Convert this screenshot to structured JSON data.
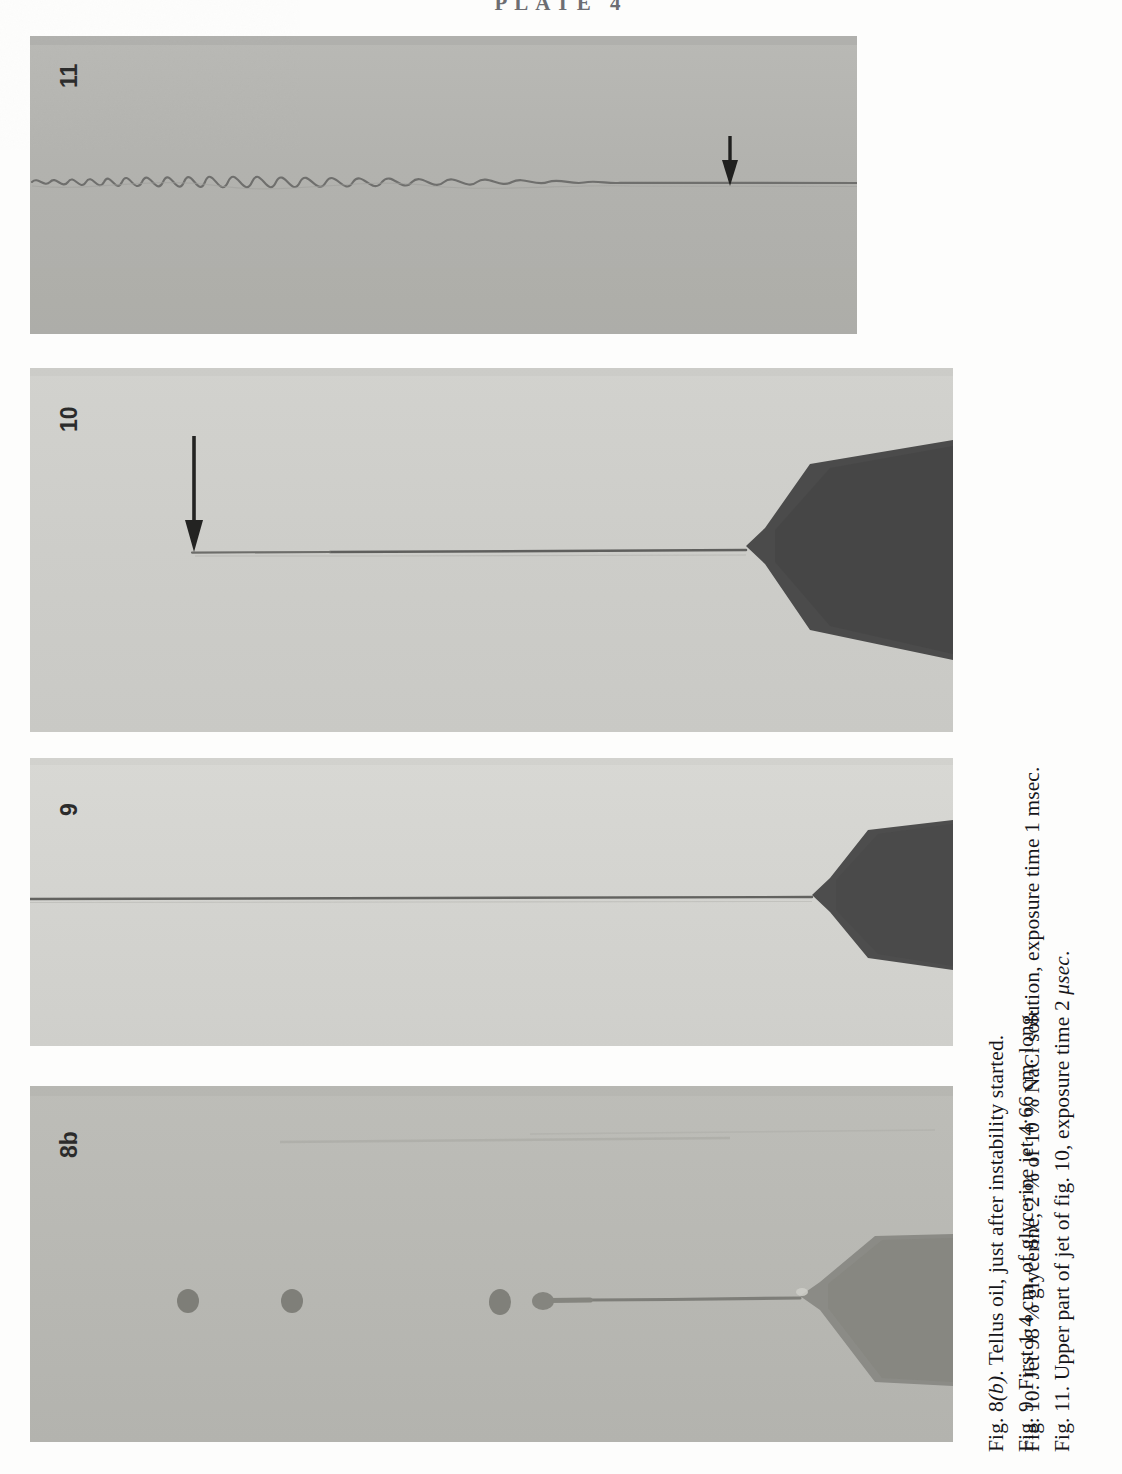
{
  "plate": {
    "header": "PLATE 4"
  },
  "panels": [
    {
      "id": "panel-11",
      "label": "11",
      "description": "Wavy sinuous jet with downward arrow marking onset of waves",
      "background": "#b4b4b0",
      "has_arrow": true,
      "has_nozzle": false
    },
    {
      "id": "panel-10",
      "label": "10",
      "description": "Long smooth glycerine jet issuing from dark nozzle at right, downward arrow",
      "background": "#cfcfcb",
      "has_arrow": true,
      "has_nozzle": true
    },
    {
      "id": "panel-9",
      "label": "9",
      "description": "First 1.4 cm of glycerine jet issuing from dark nozzle at right",
      "background": "#d4d4d0",
      "has_arrow": false,
      "has_nozzle": true
    },
    {
      "id": "panel-8b",
      "label": "8b",
      "description": "Tellus oil jet just after instability started, three detached drops",
      "background": "#b9b9b4",
      "has_arrow": false,
      "has_nozzle": true,
      "drop_count": 3
    }
  ],
  "captions": {
    "left_column": [
      {
        "id": "caption-fig-8b",
        "figure": "Fig. 8",
        "figure_suffix": "(b)",
        "text": ". Tellus oil, just after instability started."
      },
      {
        "id": "caption-fig-9",
        "figure": "Fig. 9.",
        "text": " First 1·4 cm. of glycerine jet 4·66 cm. long."
      }
    ],
    "right_column": [
      {
        "id": "caption-fig-10",
        "figure": "Fig. 10.",
        "text": " Jet 98 % glycerine, 2 % of 10 % NaCl solution, exposure time 1 msec."
      },
      {
        "id": "caption-fig-11",
        "figure": "Fig. 11.",
        "text": " Upper part of jet of fig. 10, exposure time 2 ",
        "unit_italic": "μsec",
        "text_end": "."
      }
    ]
  },
  "colors": {
    "paper": "#fdfdfc",
    "ink": "#16161a",
    "nozzle_dark": "#4a4a4a",
    "nozzle_mid": "#7b7b77",
    "jet_line": "#6a6a68"
  }
}
